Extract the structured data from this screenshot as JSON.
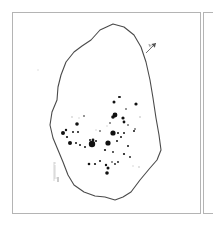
{
  "figure": {
    "panels": [
      {
        "id": "main",
        "content": "site-outline-with-distribution-dots"
      },
      {
        "id": "next",
        "content": "adjacent-panel-cropped"
      }
    ],
    "north_arrow": {
      "label": "N",
      "angle_deg": 45
    },
    "scale_bar": {
      "orientation": "vertical",
      "ticks": 8
    },
    "colors": {
      "outline": "#4a4a4a",
      "dots": "#111111",
      "frame": "#b4b4b4",
      "faint_dots": "#cfcfcf"
    },
    "outline_points": "113,24 124,27 134,35 141,47 146,62 150,80 153,98 156,118 159,135 161,150 157,160 150,168 140,180 131,192 123,197 115,200 105,197 95,196 84,192 74,185 68,175 63,162 58,150 53,138 50,125 52,112 57,100 58,87 61,75 66,62 74,52 82,46 91,40 100,30"
  },
  "chart_data": {
    "type": "scatter",
    "title": "",
    "xlabel": "",
    "ylabel": "",
    "points": [
      {
        "x": 92,
        "y": 144,
        "r": 3.2
      },
      {
        "x": 108,
        "y": 143,
        "r": 2.6
      },
      {
        "x": 113,
        "y": 133,
        "r": 2.6
      },
      {
        "x": 115,
        "y": 115,
        "r": 2.4
      },
      {
        "x": 113,
        "y": 117,
        "r": 1.8
      },
      {
        "x": 70,
        "y": 143,
        "r": 2.0
      },
      {
        "x": 63,
        "y": 133,
        "r": 2.0
      },
      {
        "x": 77,
        "y": 124,
        "r": 1.8
      },
      {
        "x": 123,
        "y": 118,
        "r": 1.6
      },
      {
        "x": 124,
        "y": 122,
        "r": 1.4
      },
      {
        "x": 114,
        "y": 102,
        "r": 1.5
      },
      {
        "x": 119,
        "y": 97,
        "r": 1.0
      },
      {
        "x": 136,
        "y": 104,
        "r": 1.6
      },
      {
        "x": 107,
        "y": 173,
        "r": 1.8
      },
      {
        "x": 108,
        "y": 168,
        "r": 1.5
      },
      {
        "x": 106,
        "y": 165,
        "r": 1.2
      },
      {
        "x": 89,
        "y": 164,
        "r": 1.3
      },
      {
        "x": 95,
        "y": 164,
        "r": 1.1
      },
      {
        "x": 100,
        "y": 161,
        "r": 1.0
      },
      {
        "x": 105,
        "y": 150,
        "r": 1.1
      },
      {
        "x": 66,
        "y": 130,
        "r": 1.2
      },
      {
        "x": 67,
        "y": 137,
        "r": 1.1
      },
      {
        "x": 73,
        "y": 132,
        "r": 1.0
      },
      {
        "x": 78,
        "y": 132,
        "r": 1.0
      },
      {
        "x": 76,
        "y": 143,
        "r": 1.0
      },
      {
        "x": 80,
        "y": 145,
        "r": 1.0
      },
      {
        "x": 85,
        "y": 147,
        "r": 1.0
      },
      {
        "x": 93,
        "y": 140,
        "r": 1.4
      },
      {
        "x": 90,
        "y": 140,
        "r": 1.0
      },
      {
        "x": 96,
        "y": 141,
        "r": 1.0
      },
      {
        "x": 118,
        "y": 133,
        "r": 1.0
      },
      {
        "x": 121,
        "y": 137,
        "r": 1.0
      },
      {
        "x": 124,
        "y": 133,
        "r": 1.0
      },
      {
        "x": 117,
        "y": 141,
        "r": 1.0
      },
      {
        "x": 124,
        "y": 154,
        "r": 1.1
      },
      {
        "x": 128,
        "y": 146,
        "r": 1.0
      },
      {
        "x": 130,
        "y": 157,
        "r": 0.9
      },
      {
        "x": 134,
        "y": 131,
        "r": 1.0
      },
      {
        "x": 135,
        "y": 129,
        "r": 0.8
      },
      {
        "x": 113,
        "y": 152,
        "r": 0.9
      },
      {
        "x": 118,
        "y": 162,
        "r": 0.9
      },
      {
        "x": 115,
        "y": 164,
        "r": 0.9
      },
      {
        "x": 112,
        "y": 162,
        "r": 0.8
      },
      {
        "x": 128,
        "y": 125,
        "r": 0.8
      },
      {
        "x": 110,
        "y": 123,
        "r": 0.8
      },
      {
        "x": 120,
        "y": 97,
        "r": 0.9
      },
      {
        "x": 84,
        "y": 116,
        "r": 0.8
      },
      {
        "x": 100,
        "y": 131,
        "r": 0.8
      },
      {
        "x": 126,
        "y": 109,
        "r": 0.8
      }
    ]
  }
}
